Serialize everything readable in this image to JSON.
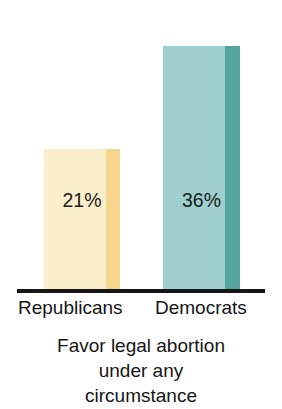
{
  "chart_data": {
    "type": "bar",
    "title": "",
    "subtitle": "",
    "caption_lines": [
      "Favor legal abortion",
      "under any",
      "circumstance"
    ],
    "categories": [
      "Republicans",
      "Democrats"
    ],
    "values": [
      21,
      36
    ],
    "value_labels": [
      "21%",
      "36%"
    ],
    "xlabel": "",
    "ylabel": "",
    "ylim": [
      0,
      36
    ],
    "grid": false,
    "legend": "none",
    "axis": {
      "baseline_visible": true,
      "baseline_color": "#161616"
    },
    "bars": [
      {
        "category": "Republicans",
        "value": 21,
        "value_label": "21%",
        "face_color": "#fbeecb",
        "edge_color": "#f5d68d"
      },
      {
        "category": "Democrats",
        "value": 36,
        "value_label": "36%",
        "face_color": "#9ecfce",
        "edge_color": "#53a49e"
      }
    ]
  },
  "colors": {
    "background": "#ffffff",
    "text": "#151515",
    "republican_light": "#fbeecb",
    "republican_dark": "#f5d68d",
    "democrat_light": "#9ecfce",
    "democrat_dark": "#53a49e",
    "axis": "#161616"
  }
}
